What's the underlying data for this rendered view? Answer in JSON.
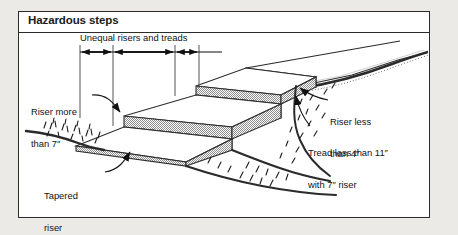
{
  "figure": {
    "title": "Hazardous steps",
    "background_color": "#eceae6",
    "panel_color": "#ffffff",
    "line_color": "#2b2b2b",
    "stipple_color": "#9a9a9a",
    "type": "isometric-line-drawing"
  },
  "dimension": {
    "label": "Unequal risers and treads",
    "icon": "double-arrow-dimension-line"
  },
  "callouts": [
    {
      "id": "riser-more-than-7",
      "line1": "Riser more",
      "line2": "than 7″",
      "icon": "curved-leader-arrow"
    },
    {
      "id": "tapered-riser",
      "line1": "Tapered",
      "line2": "riser",
      "icon": "curved-leader-arrow"
    },
    {
      "id": "riser-less-than-4",
      "line1": "Riser less",
      "line2": "than 4″",
      "icon": "curved-leader-arrow"
    },
    {
      "id": "tread-less-than-11",
      "line1": "Tread less than 11″",
      "line2": "with 7″ riser",
      "icon": "curved-leader-arrow"
    }
  ]
}
